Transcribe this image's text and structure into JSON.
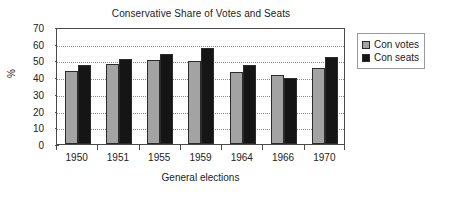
{
  "chart_data": {
    "type": "bar",
    "title": "Conservative Share of Votes and Seats",
    "xlabel": "General elections",
    "ylabel": "%",
    "categories": [
      "1950",
      "1951",
      "1955",
      "1959",
      "1964",
      "1966",
      "1970"
    ],
    "series": [
      {
        "name": "Con votes",
        "color": "#a3a3a3",
        "values": [
          43.5,
          48.0,
          50.0,
          49.5,
          43.0,
          41.5,
          45.5
        ]
      },
      {
        "name": "Con seats",
        "color": "#151515",
        "values": [
          47.5,
          51.0,
          54.0,
          57.5,
          47.5,
          39.5,
          52.0
        ]
      }
    ],
    "ylim": [
      0,
      70
    ],
    "yticks": [
      0,
      10,
      20,
      30,
      40,
      50,
      60,
      70
    ],
    "ytick_labels": [
      "0",
      "10",
      "20",
      "30",
      "40",
      "50",
      "60",
      "70"
    ],
    "grid": true,
    "grid_axis": "y",
    "legend_position": "right",
    "legend_entries": [
      "Con votes",
      "Con seats"
    ]
  }
}
